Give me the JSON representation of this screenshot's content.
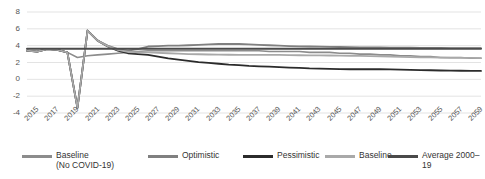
{
  "chart_data": {
    "type": "line",
    "title": "",
    "xlabel": "",
    "ylabel": "",
    "ylim": [
      -4,
      8
    ],
    "ytick_values": [
      8,
      6,
      4,
      2,
      0,
      -2,
      -4
    ],
    "ytick_labels": [
      "8",
      "6",
      "4",
      "2",
      "0",
      "-2",
      "-4"
    ],
    "grid": true,
    "grid_axis": "y",
    "xlim": [
      2015,
      2060
    ],
    "x": [
      2015,
      2016,
      2017,
      2018,
      2019,
      2020,
      2021,
      2022,
      2023,
      2024,
      2025,
      2026,
      2027,
      2028,
      2029,
      2030,
      2031,
      2032,
      2033,
      2034,
      2035,
      2036,
      2037,
      2038,
      2039,
      2040,
      2041,
      2042,
      2043,
      2044,
      2045,
      2046,
      2047,
      2048,
      2049,
      2050,
      2051,
      2052,
      2053,
      2054,
      2055,
      2056,
      2057,
      2058,
      2059,
      2060
    ],
    "xtick_labels": [
      "2015",
      "2017",
      "2019",
      "2021",
      "2023",
      "2025",
      "2027",
      "2029",
      "2031",
      "2033",
      "2035",
      "2037",
      "2039",
      "2041",
      "2043",
      "2045",
      "2047",
      "2049",
      "2051",
      "2053",
      "2055",
      "2057",
      "2059"
    ],
    "legend_position": "bottom",
    "series": [
      {
        "name": "Baseline\n(No COVID-19)",
        "color": "#8c8c8c",
        "width": 1.6,
        "values": [
          3.4,
          3.3,
          3.6,
          3.5,
          3.2,
          2.6,
          2.8,
          2.9,
          3.0,
          3.1,
          3.2,
          3.3,
          3.4,
          3.4,
          3.4,
          3.4,
          3.4,
          3.4,
          3.4,
          3.4,
          3.4,
          3.4,
          3.4,
          3.4,
          3.3,
          3.3,
          3.3,
          3.3,
          3.2,
          3.2,
          3.2,
          3.1,
          3.1,
          3.0,
          3.0,
          2.9,
          2.9,
          2.8,
          2.8,
          2.7,
          2.7,
          2.6,
          2.6,
          2.6,
          2.5,
          2.5
        ]
      },
      {
        "name": "Optimistic",
        "color": "#808080",
        "width": 1.8,
        "values": [
          3.4,
          3.3,
          3.6,
          3.5,
          3.2,
          -3.4,
          5.8,
          4.6,
          4.0,
          3.6,
          3.4,
          3.6,
          3.9,
          3.95,
          4.0,
          4.0,
          4.05,
          4.1,
          4.15,
          4.2,
          4.22,
          4.2,
          4.15,
          4.1,
          4.05,
          4.0,
          3.95,
          3.92,
          3.9,
          3.88,
          3.86,
          3.84,
          3.82,
          3.8,
          3.79,
          3.78,
          3.77,
          3.76,
          3.75,
          3.74,
          3.73,
          3.72,
          3.71,
          3.7,
          3.7,
          3.7
        ]
      },
      {
        "name": "Pessimistic",
        "color": "#2b2b2b",
        "width": 1.8,
        "values": [
          3.4,
          3.3,
          3.6,
          3.5,
          3.2,
          -3.4,
          5.8,
          4.6,
          3.9,
          3.4,
          3.1,
          3.0,
          2.9,
          2.7,
          2.5,
          2.35,
          2.2,
          2.05,
          1.95,
          1.85,
          1.75,
          1.68,
          1.6,
          1.55,
          1.5,
          1.45,
          1.4,
          1.35,
          1.3,
          1.28,
          1.25,
          1.22,
          1.2,
          1.2,
          1.2,
          1.2,
          1.18,
          1.15,
          1.12,
          1.1,
          1.08,
          1.05,
          1.03,
          1.02,
          1.0,
          1.0
        ]
      },
      {
        "name": "Baseline",
        "color": "#a9a9a9",
        "width": 1.8,
        "values": [
          3.4,
          3.3,
          3.6,
          3.5,
          3.2,
          -3.4,
          5.8,
          4.6,
          3.95,
          3.5,
          3.25,
          3.2,
          3.2,
          3.15,
          3.1,
          3.05,
          3.0,
          2.98,
          2.95,
          2.93,
          2.92,
          2.9,
          2.9,
          2.9,
          2.9,
          2.9,
          2.88,
          2.86,
          2.85,
          2.84,
          2.83,
          2.82,
          2.8,
          2.78,
          2.76,
          2.72,
          2.7,
          2.68,
          2.65,
          2.62,
          2.6,
          2.58,
          2.56,
          2.55,
          2.54,
          2.53
        ]
      },
      {
        "name": "Average 2000–19",
        "color": "#4a4a4a",
        "width": 2.0,
        "values": [
          3.63,
          3.63,
          3.63,
          3.63,
          3.63,
          3.63,
          3.63,
          3.63,
          3.63,
          3.63,
          3.63,
          3.63,
          3.63,
          3.63,
          3.63,
          3.63,
          3.63,
          3.63,
          3.63,
          3.63,
          3.63,
          3.63,
          3.63,
          3.63,
          3.63,
          3.63,
          3.63,
          3.63,
          3.63,
          3.63,
          3.63,
          3.63,
          3.63,
          3.63,
          3.63,
          3.63,
          3.63,
          3.63,
          3.63,
          3.63,
          3.63,
          3.63,
          3.63,
          3.63,
          3.63,
          3.63
        ]
      }
    ]
  },
  "legend": {
    "items": [
      {
        "label": "Baseline\n(No COVID-19)",
        "color": "#8c8c8c"
      },
      {
        "label": "Optimistic",
        "color": "#808080"
      },
      {
        "label": "Pessimistic",
        "color": "#2b2b2b"
      },
      {
        "label": "Baseline",
        "color": "#a9a9a9"
      },
      {
        "label": "Average 2000–19",
        "color": "#4a4a4a"
      }
    ]
  }
}
